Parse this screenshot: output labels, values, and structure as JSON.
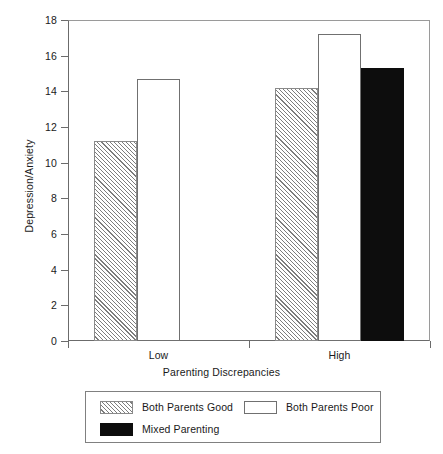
{
  "chart_data": {
    "type": "bar",
    "title": "",
    "xlabel": "Parenting Discrepancies",
    "ylabel": "Depression/Anxiety",
    "categories": [
      "Low",
      "High"
    ],
    "ylim": [
      0,
      18
    ],
    "yticks": [
      0,
      2,
      4,
      6,
      8,
      10,
      12,
      14,
      16,
      18
    ],
    "ytick_labels": [
      "0",
      "2",
      "4",
      "6",
      "8",
      "10",
      "12",
      "14",
      "16",
      "18"
    ],
    "grid": false,
    "legend_position": "below-axes",
    "series": [
      {
        "name": "Both Parents Good",
        "fill": "hatched-diagonal",
        "values": [
          11.2,
          14.2
        ]
      },
      {
        "name": "Both Parents Poor",
        "fill": "open-white",
        "values": [
          14.7,
          17.2
        ]
      },
      {
        "name": "Mixed Parenting",
        "fill": "solid-black",
        "values": [
          null,
          15.3
        ]
      }
    ],
    "bars": [
      {
        "category": "Low",
        "series": "Both Parents Good",
        "value": 11.2,
        "style": "hatch"
      },
      {
        "category": "Low",
        "series": "Both Parents Poor",
        "value": 14.7,
        "style": "open"
      },
      {
        "category": "High",
        "series": "Both Parents Good",
        "value": 14.2,
        "style": "hatch"
      },
      {
        "category": "High",
        "series": "Both Parents Poor",
        "value": 17.2,
        "style": "open"
      },
      {
        "category": "High",
        "series": "Mixed Parenting",
        "value": 15.3,
        "style": "solid"
      }
    ]
  },
  "legend": {
    "entries": [
      {
        "label": "Both Parents Good",
        "style": "hatch"
      },
      {
        "label": "Both Parents Poor",
        "style": "open"
      },
      {
        "label": "Mixed Parenting",
        "style": "solid"
      }
    ]
  },
  "colors": {
    "axis": "#6b6b6b",
    "frame": "#9a9a9a",
    "bar_outline": "#8a8a8a",
    "solid_fill": "#0d0d0d",
    "background": "#ffffff",
    "text": "#1a1a1a"
  }
}
